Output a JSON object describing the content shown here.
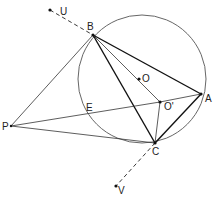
{
  "diagram": {
    "labels": {
      "U": "U",
      "B": "B",
      "O": "O",
      "O_prime": "O'",
      "A": "A",
      "E": "E",
      "P": "P",
      "C": "C",
      "V": "V"
    },
    "line_color": "#111111",
    "background": "#ffffff"
  }
}
